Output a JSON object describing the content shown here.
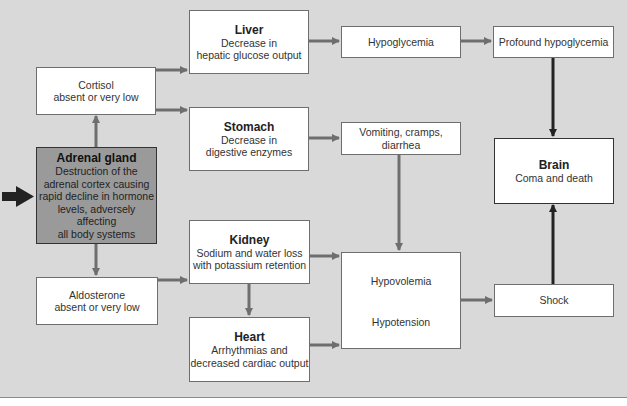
{
  "diagram": {
    "nodes": {
      "liver": {
        "title": "Liver",
        "lines": [
          "Decrease in",
          "hepatic glucose output"
        ]
      },
      "cortisol": {
        "lines": [
          "Cortisol",
          "absent or very low"
        ]
      },
      "stomach": {
        "title": "Stomach",
        "lines": [
          "Decrease in",
          "digestive enzymes"
        ]
      },
      "adrenal": {
        "title": "Adrenal gland",
        "lines": [
          "Destruction of the",
          "adrenal cortex causing",
          "rapid decline in hormone",
          "levels, adversely affecting",
          "all body systems"
        ]
      },
      "hypoglycemia": {
        "lines": [
          "Hypoglycemia"
        ]
      },
      "profound": {
        "lines": [
          "Profound hypoglycemia"
        ]
      },
      "vomiting": {
        "lines": [
          "Vomiting, cramps, diarrhea"
        ]
      },
      "brain": {
        "title": "Brain",
        "lines": [
          "Coma and death"
        ]
      },
      "kidney": {
        "title": "Kidney",
        "lines": [
          "Sodium and water loss",
          "with potassium retention"
        ]
      },
      "aldosterone": {
        "lines": [
          "Aldosterone",
          "absent or very low"
        ]
      },
      "hypo_combined": {
        "lines": [
          "Hypovolemia",
          "Hypotension"
        ]
      },
      "shock": {
        "lines": [
          "Shock"
        ]
      },
      "heart": {
        "title": "Heart",
        "lines": [
          "Arrhythmias and",
          "decreased cardiac output"
        ]
      }
    },
    "edges": [
      [
        "entry",
        "adrenal"
      ],
      [
        "adrenal",
        "cortisol"
      ],
      [
        "adrenal",
        "aldosterone"
      ],
      [
        "cortisol",
        "liver"
      ],
      [
        "cortisol",
        "stomach"
      ],
      [
        "liver",
        "hypoglycemia"
      ],
      [
        "hypoglycemia",
        "profound"
      ],
      [
        "profound",
        "brain"
      ],
      [
        "stomach",
        "vomiting"
      ],
      [
        "vomiting",
        "hypo_combined"
      ],
      [
        "aldosterone",
        "kidney"
      ],
      [
        "kidney",
        "heart"
      ],
      [
        "kidney",
        "hypo_combined"
      ],
      [
        "heart",
        "hypo_combined"
      ],
      [
        "hypo_combined",
        "shock"
      ],
      [
        "shock",
        "brain"
      ]
    ],
    "colors": {
      "background": "#d9d9d9",
      "box": "#ffffff",
      "adrenal_fill": "#9a9a9a",
      "arrow_gray": "#6e6e6e",
      "arrow_dark": "#222222"
    }
  }
}
